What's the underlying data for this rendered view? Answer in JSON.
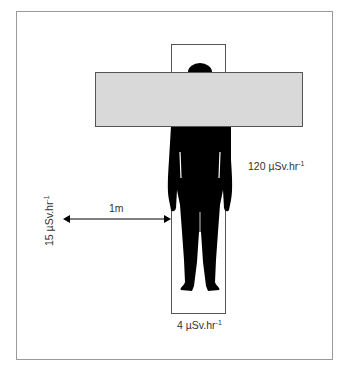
{
  "figure": {
    "type": "radiation dose rate diagram",
    "labels": {
      "dose_side": {
        "value": "120",
        "unit": "µSv.hr",
        "exponent": "-1"
      },
      "dose_feet": {
        "value": "4",
        "unit": "µSv.hr",
        "exponent": "-1"
      },
      "dose_1m": {
        "value": "15",
        "unit": "µSv.hr",
        "exponent": "-1"
      },
      "distance": "1m"
    },
    "colors": {
      "frame": "#9a9a9a",
      "bar_fill": "#d9d9d9",
      "bar_stroke": "#555555",
      "silhouette": "#000000",
      "outline_box": "#555555"
    }
  }
}
